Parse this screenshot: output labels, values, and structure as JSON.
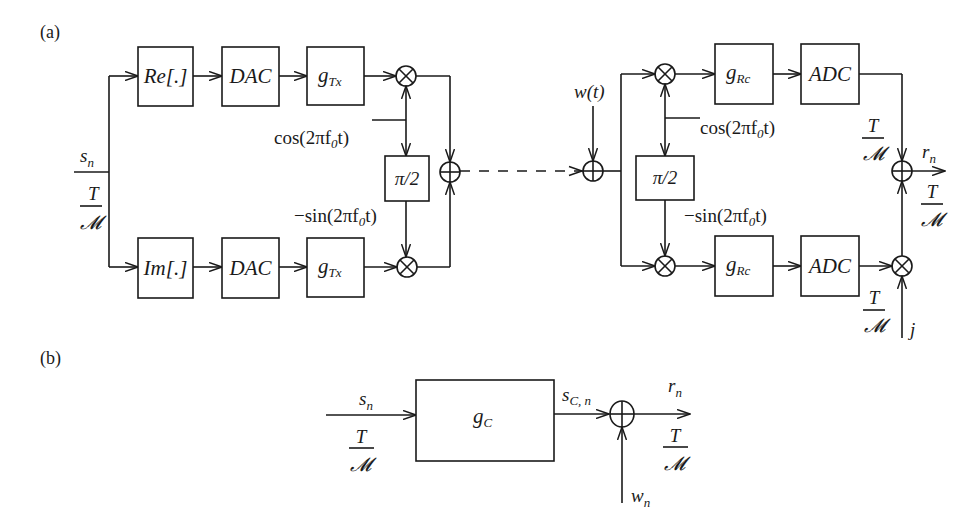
{
  "figure": {
    "panel_a": {
      "label": "(a)",
      "transmitter": {
        "input_signal": "s",
        "input_signal_sub": "n",
        "rate_num": "T",
        "rate_den": "𝓜",
        "upper_branch": [
          "Re[.]",
          "DAC",
          "g",
          "Tx"
        ],
        "lower_branch": [
          "Im[.]",
          "DAC",
          "g",
          "Tx"
        ],
        "re_label": "Re[.]",
        "im_label": "Im[.]",
        "dac_label": "DAC",
        "filter_main": "g",
        "filter_sub": "Tx",
        "cos_label": "cos(2πf",
        "cos_sub": "0",
        "cos_end": "t)",
        "sin_label": "−sin(2πf",
        "sin_sub": "0",
        "sin_end": "t)",
        "phase_shift": "π/2"
      },
      "channel": {
        "noise_label": "w(t)"
      },
      "receiver": {
        "filter_main": "g",
        "filter_sub": "Rc",
        "adc_label": "ADC",
        "cos_label": "cos(2πf",
        "cos_sub": "0",
        "cos_end": "t)",
        "sin_label": "−sin(2πf",
        "sin_sub": "0",
        "sin_end": "t)",
        "phase_shift": "π/2",
        "rate_num": "T",
        "rate_den": "𝓜",
        "output_signal": "r",
        "output_signal_sub": "n",
        "imag_unit": "j"
      }
    },
    "panel_b": {
      "label": "(b)",
      "input_signal": "s",
      "input_signal_sub": "n",
      "rate_num": "T",
      "rate_den": "𝓜",
      "channel_main": "g",
      "channel_sub": "C",
      "channel_output": "s",
      "channel_output_sub": "C, n",
      "noise": "w",
      "noise_sub": "n",
      "output_signal": "r",
      "output_signal_sub": "n"
    }
  }
}
